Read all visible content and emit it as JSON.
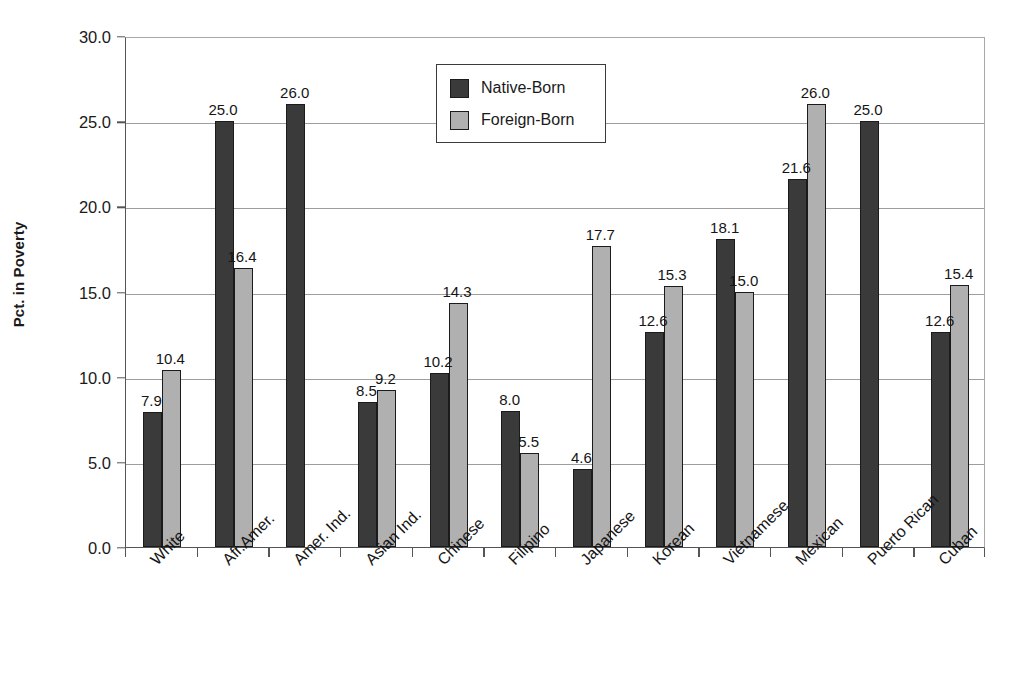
{
  "chart_data": {
    "type": "bar",
    "title": "",
    "xlabel": "",
    "ylabel": "Pct. in Poverty",
    "ylim": [
      0.0,
      30.0
    ],
    "ytick_step": 5.0,
    "ytick_labels": [
      "0.0",
      "5.0",
      "10.0",
      "15.0",
      "20.0",
      "25.0",
      "30.0"
    ],
    "grid": true,
    "legend_position": "top-center",
    "value_labels": true,
    "categories": [
      "White",
      "Afr.Amer.",
      "Amer. Ind.",
      "Asian Ind.",
      "Chinese",
      "Filipino",
      "Japanese",
      "Korean",
      "Vietnamese",
      "Mexican",
      "Puerto Rican",
      "Cuban"
    ],
    "series": [
      {
        "name": "Native-Born",
        "color": "#3a3a3a",
        "values": [
          7.9,
          25.0,
          26.0,
          8.5,
          10.2,
          8.0,
          4.6,
          12.6,
          18.1,
          21.6,
          25.0,
          12.6
        ],
        "labels": [
          "7.9",
          "25.0",
          "26.0",
          "8.5",
          "10.2",
          "8.0",
          "4.6",
          "12.6",
          "18.1",
          "21.6",
          "25.0",
          "12.6"
        ]
      },
      {
        "name": "Foreign-Born",
        "color": "#b0b0b0",
        "values": [
          10.4,
          16.4,
          null,
          9.2,
          14.3,
          5.5,
          17.7,
          15.3,
          15.0,
          26.0,
          null,
          15.4
        ],
        "labels": [
          "10.4",
          "16.4",
          "",
          "9.2",
          "14.3",
          "5.5",
          "17.7",
          "15.3",
          "15.0",
          "26.0",
          "",
          "15.4"
        ]
      }
    ]
  },
  "legend": {
    "items": [
      {
        "label": "Native-Born",
        "swatch": "native"
      },
      {
        "label": "Foreign-Born",
        "swatch": "foreign"
      }
    ]
  },
  "colors": {
    "native_born": "#3a3a3a",
    "foreign_born": "#b0b0b0",
    "axis": "#555555",
    "grid": "#9d9d9d",
    "background": "#ffffff"
  }
}
